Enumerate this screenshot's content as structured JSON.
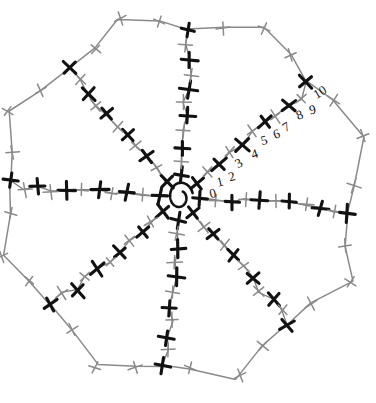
{
  "figure": {
    "background_color": "#ffffff",
    "width": 376,
    "height": 403,
    "center": {
      "x": 180,
      "y": 197
    },
    "center_mark": {
      "name": "spiral",
      "rx": 13,
      "ry": 16
    },
    "colors": {
      "dark_tick": "#121212",
      "light_tick": "#8a8a8a",
      "spine": "#7d7d7d",
      "petal": "#8a8a8a",
      "label": "#111111"
    },
    "ray_count": 8,
    "ticks_per_ray": 11,
    "tick_pattern": "alternating dark and light",
    "rays": [
      {
        "name": "ray-up",
        "angle_deg": -86,
        "length": 168
      },
      {
        "name": "ray-up-right",
        "angle_deg": -41,
        "length": 172
      },
      {
        "name": "ray-right",
        "angle_deg": 4,
        "length": 170
      },
      {
        "name": "ray-down-right",
        "angle_deg": 49,
        "length": 168
      },
      {
        "name": "ray-down",
        "angle_deg": 94,
        "length": 170
      },
      {
        "name": "ray-down-left",
        "angle_deg": 139,
        "length": 168
      },
      {
        "name": "ray-left",
        "angle_deg": 184,
        "length": 172
      },
      {
        "name": "ray-up-left",
        "angle_deg": 229,
        "length": 168
      }
    ],
    "scale_labels": {
      "name": "tick-number-scale",
      "along_ray": "ray-up-right",
      "values": [
        "0",
        "1",
        "2",
        "3",
        "4",
        "5",
        "6",
        "7",
        "8",
        "9",
        "10"
      ]
    }
  },
  "chart_data": {
    "type": "scatter",
    "xlabel": "",
    "ylabel": "",
    "grid": false,
    "legend": "none",
    "categories": [
      "0",
      "1",
      "2",
      "3",
      "4",
      "5",
      "6",
      "7",
      "8",
      "9",
      "10"
    ],
    "series": [
      {
        "name": "ray-up",
        "angle_deg": -86,
        "values": [
          0,
          1,
          2,
          3,
          4,
          5,
          6,
          7,
          8,
          9,
          10
        ]
      },
      {
        "name": "ray-up-right",
        "angle_deg": -41,
        "values": [
          0,
          1,
          2,
          3,
          4,
          5,
          6,
          7,
          8,
          9,
          10
        ]
      },
      {
        "name": "ray-right",
        "angle_deg": 4,
        "values": [
          0,
          1,
          2,
          3,
          4,
          5,
          6,
          7,
          8,
          9,
          10
        ]
      },
      {
        "name": "ray-down-right",
        "angle_deg": 49,
        "values": [
          0,
          1,
          2,
          3,
          4,
          5,
          6,
          7,
          8,
          9,
          10
        ]
      },
      {
        "name": "ray-down",
        "angle_deg": 94,
        "values": [
          0,
          1,
          2,
          3,
          4,
          5,
          6,
          7,
          8,
          9,
          10
        ]
      },
      {
        "name": "ray-down-left",
        "angle_deg": 139,
        "values": [
          0,
          1,
          2,
          3,
          4,
          5,
          6,
          7,
          8,
          9,
          10
        ]
      },
      {
        "name": "ray-left",
        "angle_deg": 184,
        "values": [
          0,
          1,
          2,
          3,
          4,
          5,
          6,
          7,
          8,
          9,
          10
        ]
      },
      {
        "name": "ray-up-left",
        "angle_deg": 229,
        "values": [
          0,
          1,
          2,
          3,
          4,
          5,
          6,
          7,
          8,
          9,
          10
        ]
      }
    ]
  }
}
